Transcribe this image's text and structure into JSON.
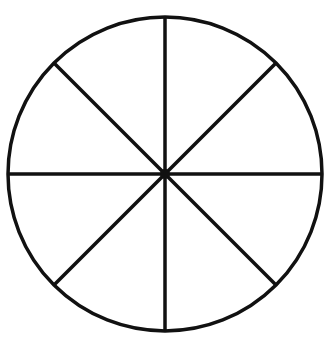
{
  "diagram": {
    "type": "circle-divided",
    "sections": 8,
    "stroke_color": "#111111",
    "background": "#ffffff",
    "circle": {
      "cx": 165,
      "cy": 174,
      "r": 157
    },
    "spoke_angles_deg": [
      0,
      45,
      90,
      135,
      180,
      225,
      270,
      315
    ],
    "center_dot": true
  }
}
